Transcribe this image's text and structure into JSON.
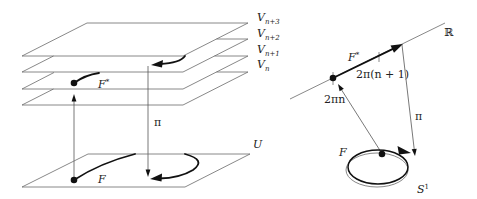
{
  "left_diagram": {
    "sheets": [
      {
        "base": "V",
        "sub": "n+3"
      },
      {
        "base": "V",
        "sub": "n+2"
      },
      {
        "base": "V",
        "sub": "n+1"
      },
      {
        "base": "V",
        "sub": "n"
      }
    ],
    "lift_label": {
      "base": "F",
      "sup": "*"
    },
    "projection_label": "π",
    "base_label": "U",
    "path_label": "F"
  },
  "right_diagram": {
    "line_label": "ℝ",
    "lift_label": {
      "base": "F",
      "sup": "*"
    },
    "point_end_label": "2π(n + 1)",
    "point_start_label": "2πn",
    "projection_label": "π",
    "loop_label": "F",
    "circle_label": {
      "base": "S",
      "sup": "1"
    }
  },
  "colors": {
    "background": "#ffffff",
    "line": "#6a6a6a",
    "bold": "#111111"
  }
}
